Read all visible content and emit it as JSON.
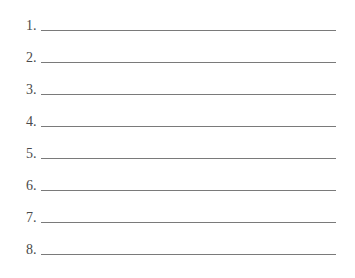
{
  "worksheet": {
    "items": [
      {
        "label": "1.",
        "value": ""
      },
      {
        "label": "2.",
        "value": ""
      },
      {
        "label": "3.",
        "value": ""
      },
      {
        "label": "4.",
        "value": ""
      },
      {
        "label": "5.",
        "value": ""
      },
      {
        "label": "6.",
        "value": ""
      },
      {
        "label": "7.",
        "value": ""
      },
      {
        "label": "8.",
        "value": ""
      }
    ]
  }
}
